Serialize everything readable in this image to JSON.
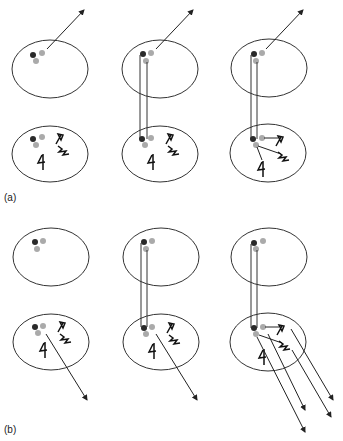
{
  "figure": {
    "panels": [
      {
        "id": "a",
        "label": "(a)"
      },
      {
        "id": "b",
        "label": "(b)"
      }
    ],
    "colors": {
      "stroke": "#333333",
      "dark_dot": "#2a2a2a",
      "light_dot": "#aaaaaa"
    },
    "legend_symbols": [
      "dark-dot",
      "light-dot",
      "hollow-arrow-glyph",
      "zigzag-glyph",
      "crossed-glyph"
    ]
  }
}
